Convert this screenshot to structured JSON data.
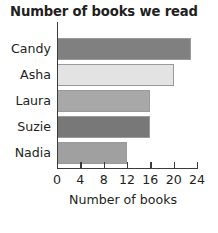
{
  "chart_data": {
    "type": "bar",
    "orientation": "horizontal",
    "title": "Number of books we read",
    "xlabel": "Number of books",
    "ylabel": "",
    "categories": [
      "Candy",
      "Asha",
      "Laura",
      "Suzie",
      "Nadia"
    ],
    "values": [
      23,
      20,
      16,
      16,
      12
    ],
    "bar_colors": [
      "#808080",
      "#e3e3e3",
      "#a8a8a8",
      "#787878",
      "#a0a0a0"
    ],
    "xlim": [
      0,
      24
    ],
    "xticks": [
      0,
      4,
      8,
      12,
      16,
      20,
      24
    ],
    "xtick_labels": [
      "0",
      "4",
      "8",
      "12",
      "16",
      "20",
      "24"
    ],
    "grid": false,
    "legend": null,
    "axis_color": "#3b3b3b",
    "bar_edge_color": "#9a9a9a",
    "text_color": "#231f20"
  }
}
